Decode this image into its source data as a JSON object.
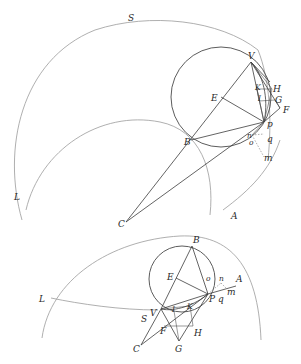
{
  "figure": {
    "top_diagram": {
      "labels": {
        "S": "S",
        "V": "V",
        "H": "H",
        "K": "K",
        "I": "I",
        "G": "G",
        "F": "F",
        "E": "E",
        "B": "B",
        "P": "p",
        "q": "q",
        "n": "n",
        "o": "o",
        "m": "m",
        "L": "L",
        "C": "C",
        "A": "A"
      }
    },
    "bottom_diagram": {
      "labels": {
        "B": "B",
        "E": "E",
        "o": "o",
        "n": "n",
        "A": "A",
        "m": "m",
        "P": "P",
        "q": "q",
        "L": "L",
        "S": "S",
        "V": "V",
        "I": "I",
        "K": "K",
        "C": "C",
        "F": "F",
        "G": "G",
        "H": "H"
      }
    },
    "colors": {
      "ink": "#3c3c3c",
      "light_arc": "#9a9a9a",
      "background": "#ffffff"
    }
  }
}
